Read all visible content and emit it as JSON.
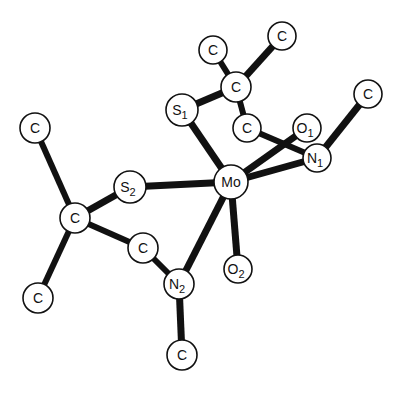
{
  "diagram": {
    "type": "molecular-structure",
    "colors": {
      "background": "#ffffff",
      "ink": "#111111"
    },
    "atoms": [
      {
        "id": "Mo",
        "element": "Mo",
        "sub": "",
        "x": 231,
        "y": 182,
        "r": 17
      },
      {
        "id": "S1",
        "element": "S",
        "sub": "1",
        "x": 182,
        "y": 110,
        "r": 16
      },
      {
        "id": "S2",
        "element": "S",
        "sub": "2",
        "x": 130,
        "y": 187,
        "r": 16
      },
      {
        "id": "O1",
        "element": "O",
        "sub": "1",
        "x": 307,
        "y": 128,
        "r": 14
      },
      {
        "id": "O2",
        "element": "O",
        "sub": "2",
        "x": 238,
        "y": 269,
        "r": 14
      },
      {
        "id": "N1",
        "element": "N",
        "sub": "1",
        "x": 317,
        "y": 158,
        "r": 14
      },
      {
        "id": "N2",
        "element": "N",
        "sub": "2",
        "x": 179,
        "y": 284,
        "r": 15
      },
      {
        "id": "C1",
        "element": "C",
        "sub": "",
        "x": 213,
        "y": 50,
        "r": 14
      },
      {
        "id": "C2",
        "element": "C",
        "sub": "",
        "x": 282,
        "y": 36,
        "r": 14
      },
      {
        "id": "C3",
        "element": "C",
        "sub": "",
        "x": 236,
        "y": 87,
        "r": 15
      },
      {
        "id": "C4",
        "element": "C",
        "sub": "",
        "x": 247,
        "y": 128,
        "r": 14
      },
      {
        "id": "C5",
        "element": "C",
        "sub": "",
        "x": 368,
        "y": 94,
        "r": 14
      },
      {
        "id": "C6",
        "element": "C",
        "sub": "",
        "x": 35,
        "y": 128,
        "r": 15
      },
      {
        "id": "C7",
        "element": "C",
        "sub": "",
        "x": 75,
        "y": 218,
        "r": 15
      },
      {
        "id": "C8",
        "element": "C",
        "sub": "",
        "x": 38,
        "y": 298,
        "r": 15
      },
      {
        "id": "C9",
        "element": "C",
        "sub": "",
        "x": 143,
        "y": 248,
        "r": 15
      },
      {
        "id": "C10",
        "element": "C",
        "sub": "",
        "x": 182,
        "y": 355,
        "r": 15
      }
    ],
    "bonds": [
      {
        "a": "Mo",
        "b": "S1",
        "w": 7
      },
      {
        "a": "Mo",
        "b": "S2",
        "w": 7
      },
      {
        "a": "Mo",
        "b": "O1",
        "w": 7
      },
      {
        "a": "Mo",
        "b": "N1",
        "w": 7
      },
      {
        "a": "Mo",
        "b": "O2",
        "w": 7
      },
      {
        "a": "Mo",
        "b": "N2",
        "w": 7
      },
      {
        "a": "S1",
        "b": "C3",
        "w": 7
      },
      {
        "a": "C3",
        "b": "C1",
        "w": 6
      },
      {
        "a": "C3",
        "b": "C2",
        "w": 7
      },
      {
        "a": "C3",
        "b": "C4",
        "w": 6
      },
      {
        "a": "C4",
        "b": "N1",
        "w": 6
      },
      {
        "a": "N1",
        "b": "C5",
        "w": 7
      },
      {
        "a": "S2",
        "b": "C7",
        "w": 7
      },
      {
        "a": "C7",
        "b": "C6",
        "w": 6
      },
      {
        "a": "C7",
        "b": "C8",
        "w": 6
      },
      {
        "a": "C7",
        "b": "C9",
        "w": 6
      },
      {
        "a": "C9",
        "b": "N2",
        "w": 6
      },
      {
        "a": "N2",
        "b": "C10",
        "w": 7
      }
    ]
  }
}
